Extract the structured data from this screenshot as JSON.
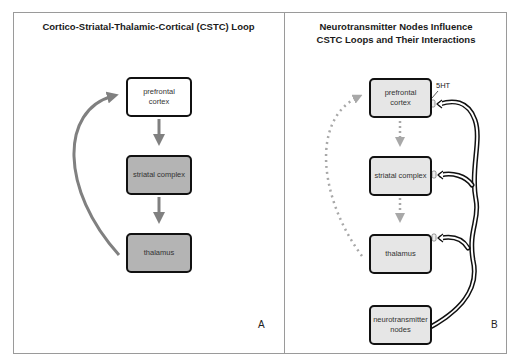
{
  "panel_a": {
    "title": "Cortico-Striatal-Thalamic-Cortical (CSTC) Loop",
    "label": "A",
    "nodes": [
      {
        "id": "prefrontal_cortex",
        "text": "prefrontal\ncortex",
        "fill": "#ffffff"
      },
      {
        "id": "striatal_complex",
        "text": "striatal complex",
        "fill": "#b4b4b4"
      },
      {
        "id": "thalamus",
        "text": "thalamus",
        "fill": "#b4b4b4"
      }
    ],
    "arrow_color": "#808080"
  },
  "panel_b": {
    "title_line1": "Neurotransmitter Nodes Influence",
    "title_line2": "CSTC Loops and Their Interactions",
    "label": "B",
    "nodes": [
      {
        "id": "prefrontal_cortex",
        "text": "prefrontal\ncortex",
        "fill": "#e6e6e6"
      },
      {
        "id": "striatal_complex",
        "text": "striatal complex",
        "fill": "#e6e6e6"
      },
      {
        "id": "thalamus",
        "text": "thalamus",
        "fill": "#e6e6e6"
      },
      {
        "id": "neurotransmitter_nodes",
        "text": "neurotransmitter\nnodes",
        "fill": "#e6e6e6"
      }
    ],
    "neurotransmitter_label": "5HT",
    "dashed_arrow_color": "#a8a8a8"
  }
}
